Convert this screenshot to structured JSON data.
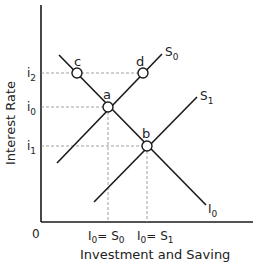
{
  "diagram": {
    "y_axis_label": "Interest Rate",
    "x_axis_label": "Investment and Saving",
    "origin_label": "0",
    "y_ticks": [
      {
        "label": "i",
        "sub": "2",
        "y": 73
      },
      {
        "label": "i",
        "sub": "0",
        "y": 107
      },
      {
        "label": "i",
        "sub": "1",
        "y": 146
      }
    ],
    "x_ticks": [
      {
        "label": "I",
        "sub": "0",
        "eq": "= S",
        "sub2": "0",
        "x": 108
      },
      {
        "label": "I",
        "sub": "0",
        "eq": "= S",
        "sub2": "1",
        "x": 147
      }
    ],
    "curves": [
      {
        "name": "I",
        "sub": "0",
        "x1": 59,
        "y1": 55,
        "x2": 206,
        "y2": 205
      },
      {
        "name": "S",
        "sub": "0",
        "x1": 57,
        "y1": 163,
        "x2": 162,
        "y2": 54
      },
      {
        "name": "S",
        "sub": "1",
        "x1": 94,
        "y1": 202,
        "x2": 197,
        "y2": 97
      }
    ],
    "points": [
      {
        "name": "a",
        "x": 108,
        "y": 107
      },
      {
        "name": "b",
        "x": 147,
        "y": 146
      },
      {
        "name": "c",
        "x": 77,
        "y": 73
      },
      {
        "name": "d",
        "x": 143,
        "y": 73
      }
    ],
    "colors": {
      "line": "#1a1a1a",
      "guide": "#888888"
    }
  }
}
